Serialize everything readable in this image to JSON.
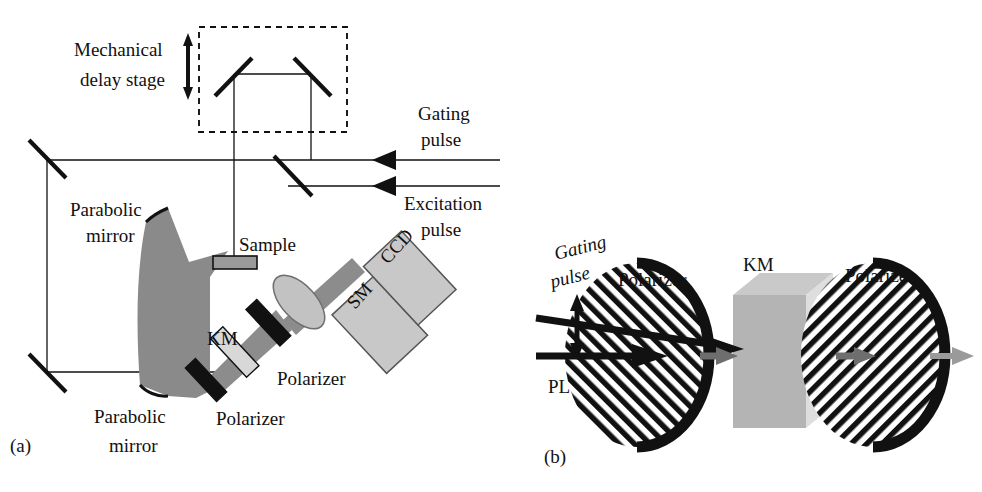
{
  "figure": {
    "background_color": "#ffffff",
    "ink_color": "#111111",
    "width": 982,
    "height": 492
  },
  "panel_a": {
    "letter": "(a)",
    "labels": {
      "mechanical_delay_line1": "Mechanical",
      "mechanical_delay_line2": "delay stage",
      "gating_line1": "Gating",
      "gating_line2": "pulse",
      "excitation_line1": "Excitation",
      "excitation_line2": "pulse",
      "parabolic_top_line1": "Parabolic",
      "parabolic_top_line2": "mirror",
      "parabolic_bottom_line1": "Parabolic",
      "parabolic_bottom_line2": "mirror",
      "sample": "Sample",
      "km": "KM",
      "polarizer_lower": "Polarizer",
      "polarizer_upper": "Polarizer",
      "ccd": "CCD",
      "sm": "SM"
    },
    "colors": {
      "beam_cone_gray": "#8c8c8c",
      "parabolic_mirror_gray": "#8a8a8a",
      "detector_box_gray": "#c8c8c8",
      "lens_gray": "#c2c2c2",
      "km_crystal_gray": "#d8d8d8",
      "polarizer_black": "#111111",
      "sample_gray": "#9a9a9a"
    }
  },
  "panel_b": {
    "letter": "(b)",
    "labels": {
      "gating_line1": "Gating",
      "gating_line2": "pulse",
      "polarizer_first": "Polarizer",
      "km": "KM",
      "polarizer_second": "Polarizer",
      "pl": "PL"
    },
    "colors": {
      "hatch_black": "#111111",
      "km_front_gray": "#b4b4b4",
      "km_top_gray": "#c9c9c9",
      "km_side_gray": "#dedede",
      "out_arrow_gray": "#9a9a9a",
      "mid_arrow_gray": "#6e6e6e"
    }
  }
}
